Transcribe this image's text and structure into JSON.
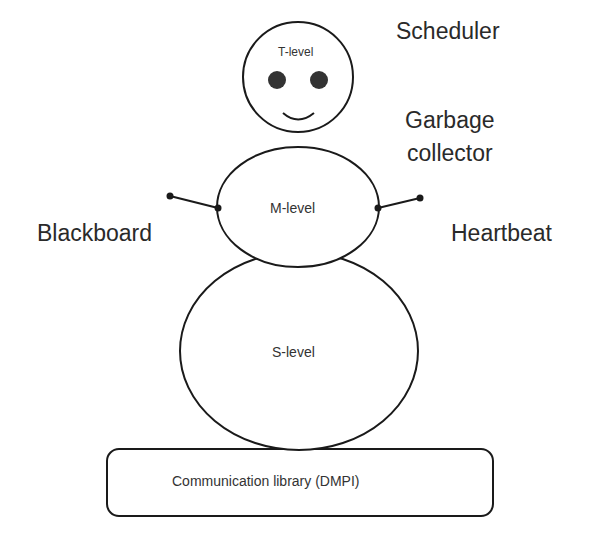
{
  "diagram": {
    "type": "snowman-architecture",
    "levels": [
      {
        "id": "t",
        "label": "T-level"
      },
      {
        "id": "m",
        "label": "M-level"
      },
      {
        "id": "s",
        "label": "S-level"
      }
    ],
    "base": {
      "label": "Communication library (DMPI)"
    },
    "components": {
      "scheduler": "Scheduler",
      "garbage_collector_line1": "Garbage",
      "garbage_collector_line2": "collector",
      "blackboard": "Blackboard",
      "heartbeat": "Heartbeat"
    },
    "colors": {
      "stroke": "#1a1a1a",
      "background": "#ffffff",
      "text": "#2a2a2a"
    }
  }
}
